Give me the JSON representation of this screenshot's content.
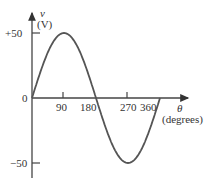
{
  "chart_data": {
    "type": "line",
    "title": "",
    "xlabel": "θ (degrees)",
    "ylabel": "v (V)",
    "ylabel_symbol": "v",
    "ylabel_unit": "(V)",
    "xlabel_symbol": "θ",
    "xlabel_unit": "(degrees)",
    "x_ticks": [
      "90",
      "180",
      "270",
      "360"
    ],
    "y_ticks": [
      "+50",
      "0",
      "−50"
    ],
    "series": [
      {
        "name": "v = 50 sin θ",
        "x": [
          0,
          45,
          90,
          135,
          180,
          225,
          270,
          315,
          360
        ],
        "y": [
          0,
          35.4,
          50,
          35.4,
          0,
          -35.4,
          -50,
          -35.4,
          0
        ]
      }
    ],
    "xlim": [
      0,
      360
    ],
    "ylim": [
      -50,
      50
    ],
    "grid": false,
    "legend": "none"
  }
}
